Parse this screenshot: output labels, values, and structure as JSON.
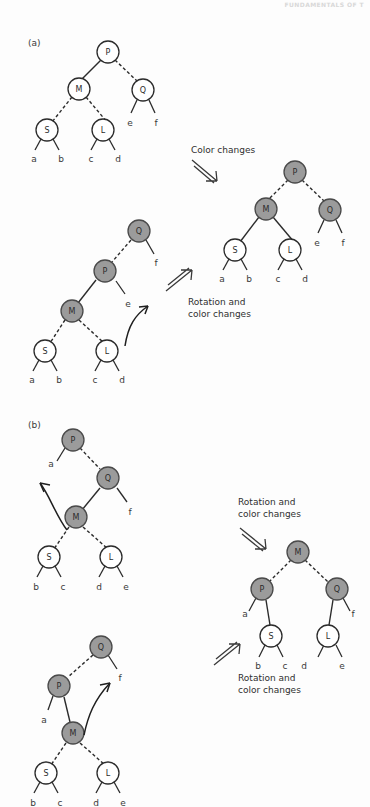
{
  "running_head": "FUNDAMENTALS OF T",
  "figure": {
    "type": "red-black-tree-rebalancing-diagram",
    "panels": [
      {
        "id": "a",
        "label": "(a)"
      },
      {
        "id": "b",
        "label": "(b)"
      }
    ],
    "transition_captions": [
      {
        "id": "color-changes",
        "text": "Color changes",
        "arrow": "down-right"
      },
      {
        "id": "rotation-and-color-changes-a",
        "text": "Rotation and\ncolor changes",
        "arrow": "up-right"
      },
      {
        "id": "rotation-and-color-changes-b1",
        "text": "Rotation and\ncolor changes",
        "arrow": "down-right"
      },
      {
        "id": "rotation-and-color-changes-b2",
        "text": "Rotation and\ncolor changes",
        "arrow": "up-right"
      }
    ],
    "colors": {
      "node_red": "#9b9b9b",
      "node_black": "#ffffff",
      "stroke": "#2b2b2b",
      "text": "#2f2f2f",
      "background": "#fdfdfd"
    },
    "legend_note": {
      "gray_fill_means": "red node",
      "white_fill_means": "black node",
      "dashed_edge_means": "red link",
      "solid_edge_means": "black link"
    },
    "trees": [
      {
        "id": "a-before-1",
        "panel": "a",
        "nodes": [
          {
            "name": "P",
            "color": "black"
          },
          {
            "name": "M",
            "color": "black"
          },
          {
            "name": "Q",
            "color": "black"
          },
          {
            "name": "S",
            "color": "black"
          },
          {
            "name": "L",
            "color": "black"
          }
        ],
        "leaves": [
          "a",
          "b",
          "c",
          "d",
          "e",
          "f"
        ],
        "edges": [
          {
            "from": "P",
            "to": "M",
            "style": "solid"
          },
          {
            "from": "P",
            "to": "Q",
            "style": "dashed"
          },
          {
            "from": "M",
            "to": "S",
            "style": "dashed"
          },
          {
            "from": "M",
            "to": "L",
            "style": "dashed"
          }
        ]
      },
      {
        "id": "a-after",
        "panel": "a",
        "nodes": [
          {
            "name": "P",
            "color": "red"
          },
          {
            "name": "M",
            "color": "red"
          },
          {
            "name": "Q",
            "color": "red"
          },
          {
            "name": "S",
            "color": "black"
          },
          {
            "name": "L",
            "color": "black"
          }
        ],
        "leaves": [
          "a",
          "b",
          "c",
          "d",
          "e",
          "f"
        ],
        "edges": [
          {
            "from": "P",
            "to": "M",
            "style": "dashed"
          },
          {
            "from": "P",
            "to": "Q",
            "style": "dashed"
          },
          {
            "from": "M",
            "to": "S",
            "style": "solid"
          },
          {
            "from": "M",
            "to": "L",
            "style": "solid"
          }
        ]
      },
      {
        "id": "a-before-2",
        "panel": "a",
        "nodes": [
          {
            "name": "Q",
            "color": "red"
          },
          {
            "name": "P",
            "color": "red"
          },
          {
            "name": "M",
            "color": "red"
          },
          {
            "name": "S",
            "color": "black"
          },
          {
            "name": "L",
            "color": "black"
          }
        ],
        "leaves": [
          "a",
          "b",
          "c",
          "d",
          "e",
          "f"
        ],
        "edges": [
          {
            "from": "Q",
            "to": "P",
            "style": "dashed"
          },
          {
            "from": "P",
            "to": "M",
            "style": "solid"
          },
          {
            "from": "M",
            "to": "S",
            "style": "dashed"
          },
          {
            "from": "M",
            "to": "L",
            "style": "dashed"
          }
        ],
        "rotation_arrow": "curved-up-right"
      },
      {
        "id": "b-before-1",
        "panel": "b",
        "nodes": [
          {
            "name": "P",
            "color": "red"
          },
          {
            "name": "Q",
            "color": "red"
          },
          {
            "name": "M",
            "color": "red"
          },
          {
            "name": "S",
            "color": "black"
          },
          {
            "name": "L",
            "color": "black"
          }
        ],
        "leaves": [
          "a",
          "b",
          "c",
          "d",
          "e",
          "f"
        ],
        "edges": [
          {
            "from": "P",
            "to": "Q",
            "style": "dashed"
          },
          {
            "from": "Q",
            "to": "M",
            "style": "solid"
          },
          {
            "from": "M",
            "to": "S",
            "style": "dashed"
          },
          {
            "from": "M",
            "to": "L",
            "style": "dashed"
          }
        ],
        "rotation_arrow": "curved-up-left"
      },
      {
        "id": "b-after",
        "panel": "b",
        "nodes": [
          {
            "name": "M",
            "color": "red"
          },
          {
            "name": "P",
            "color": "red"
          },
          {
            "name": "Q",
            "color": "red"
          },
          {
            "name": "S",
            "color": "black"
          },
          {
            "name": "L",
            "color": "black"
          }
        ],
        "leaves": [
          "a",
          "b",
          "c",
          "d",
          "e",
          "f"
        ],
        "edges": [
          {
            "from": "M",
            "to": "P",
            "style": "dashed"
          },
          {
            "from": "M",
            "to": "Q",
            "style": "dashed"
          },
          {
            "from": "P",
            "to": "S",
            "style": "solid"
          },
          {
            "from": "Q",
            "to": "L",
            "style": "solid"
          }
        ]
      },
      {
        "id": "b-before-2",
        "panel": "b",
        "nodes": [
          {
            "name": "Q",
            "color": "red"
          },
          {
            "name": "P",
            "color": "red"
          },
          {
            "name": "M",
            "color": "red"
          },
          {
            "name": "S",
            "color": "black"
          },
          {
            "name": "L",
            "color": "black"
          }
        ],
        "leaves": [
          "a",
          "b",
          "c",
          "d",
          "e",
          "f"
        ],
        "edges": [
          {
            "from": "Q",
            "to": "P",
            "style": "dashed"
          },
          {
            "from": "P",
            "to": "M",
            "style": "solid"
          },
          {
            "from": "M",
            "to": "S",
            "style": "dashed"
          },
          {
            "from": "M",
            "to": "L",
            "style": "dashed"
          }
        ],
        "rotation_arrow": "curved-up-right"
      }
    ]
  },
  "labels": {
    "panel_a": "(a)",
    "panel_b": "(b)",
    "color_changes": "Color changes",
    "rotation_and_color_changes_line1": "Rotation and",
    "rotation_and_color_changes_line2": "color changes",
    "n_P": "P",
    "n_M": "M",
    "n_Q": "Q",
    "n_S": "S",
    "n_L": "L",
    "leaf_a": "a",
    "leaf_b": "b",
    "leaf_c": "c",
    "leaf_d": "d",
    "leaf_e": "e",
    "leaf_f": "f"
  }
}
